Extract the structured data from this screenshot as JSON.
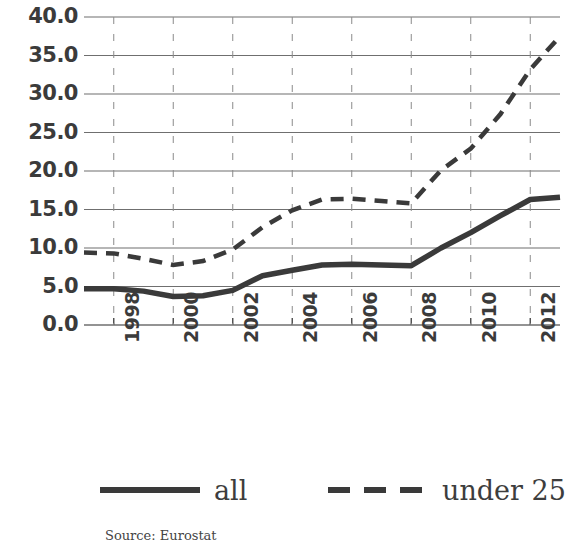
{
  "chart_data": {
    "type": "line",
    "title": "",
    "subtitle": "",
    "xlabel": "",
    "ylabel": "",
    "source": "Source: Eurostat",
    "grid": true,
    "legend_position": "bottom",
    "xlim": [
      1997,
      2013
    ],
    "ylim": [
      0.0,
      40.0
    ],
    "y_ticks": [
      "40.0",
      "35.0",
      "30.0",
      "25.0",
      "20.0",
      "15.0",
      "10.0",
      "5.0",
      "0.0"
    ],
    "y_tick_values": [
      40,
      35,
      30,
      25,
      20,
      15,
      10,
      5,
      0
    ],
    "x_ticks": [
      "1998",
      "2000",
      "2002",
      "2004",
      "2006",
      "2008",
      "2010",
      "2012"
    ],
    "x_tick_values": [
      1998,
      2000,
      2002,
      2004,
      2006,
      2008,
      2010,
      2012
    ],
    "x": [
      1997,
      1998,
      1999,
      2000,
      2001,
      2002,
      2003,
      2004,
      2005,
      2006,
      2007,
      2008,
      2009,
      2010,
      2011,
      2012,
      2013
    ],
    "series": [
      {
        "name": "all",
        "style": "solid",
        "color": "#3a3a3a",
        "values": [
          4.7,
          4.7,
          4.4,
          3.7,
          3.8,
          4.5,
          6.4,
          7.1,
          7.8,
          7.9,
          7.8,
          7.7,
          10.0,
          12.0,
          14.2,
          16.3,
          16.6
        ]
      },
      {
        "name": "under 25",
        "style": "dashed",
        "color": "#3a3a3a",
        "values": [
          9.4,
          9.3,
          8.6,
          7.8,
          8.3,
          9.8,
          12.7,
          14.9,
          16.3,
          16.4,
          16.1,
          15.8,
          20.1,
          22.9,
          27.4,
          33.2,
          37.5
        ]
      }
    ]
  },
  "legend": {
    "entries": [
      {
        "label": "all",
        "style": "solid"
      },
      {
        "label": "under 25",
        "style": "dashed"
      }
    ]
  }
}
